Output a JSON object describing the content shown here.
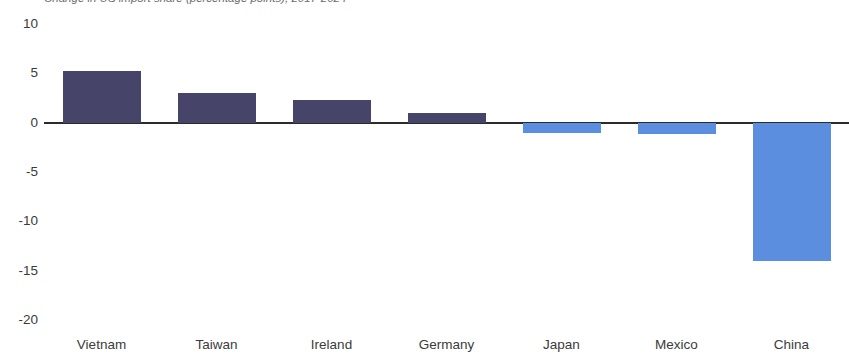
{
  "chart_data": {
    "type": "bar",
    "title": "Change in US import share (percentage points), 2017-2024",
    "subtitle": "",
    "xlabel": "",
    "ylabel": "",
    "categories": [
      "Vietnam",
      "Taiwan",
      "Ireland",
      "Germany",
      "Japan",
      "Mexico",
      "China"
    ],
    "values": [
      5.2,
      3.0,
      2.3,
      1.0,
      -1.0,
      -1.2,
      -14.0
    ],
    "series": [
      {
        "name": "Change in share",
        "values": [
          5.2,
          3.0,
          2.3,
          1.0,
          -1.0,
          -1.2,
          -14.0
        ]
      }
    ],
    "ylim": [
      -20,
      10
    ],
    "ytick_values": [
      10,
      5,
      0,
      -5,
      -10,
      -15,
      -20
    ],
    "ytick_labels": [
      "10",
      "5",
      "0",
      "-5",
      "-10",
      "-15",
      "-20"
    ],
    "grid": false,
    "legend": "none",
    "zero_line": true,
    "colors": {
      "positive_bar": "#464569",
      "negative_bar": "#5b8ede",
      "zero_line": "#2b2b2b",
      "text": "#3b3b3b",
      "background": "#ffffff"
    }
  },
  "axis": {
    "y_ticks": [
      {
        "label": "10"
      },
      {
        "label": "5"
      },
      {
        "label": "0"
      },
      {
        "label": "-5"
      },
      {
        "label": "-10"
      },
      {
        "label": "-15"
      },
      {
        "label": "-20"
      }
    ],
    "x_ticks": [
      {
        "label": "Vietnam"
      },
      {
        "label": "Taiwan"
      },
      {
        "label": "Ireland"
      },
      {
        "label": "Germany"
      },
      {
        "label": "Japan"
      },
      {
        "label": "Mexico"
      },
      {
        "label": "China"
      }
    ]
  }
}
